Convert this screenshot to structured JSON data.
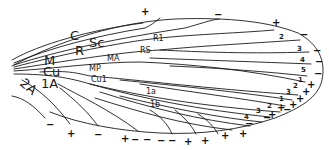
{
  "diagram": {
    "type": "insect-wing-venation",
    "vein_labels": {
      "C": "C",
      "Sc": "Sc",
      "R": "R",
      "R1": "R1",
      "RS": "RS",
      "MA": "MA",
      "M": "M",
      "Cu": "Cu",
      "MP": "MP",
      "Cu1": "Cu1",
      "1A": "1A",
      "2A": "2A",
      "1a": "1a",
      "1b": "1b"
    },
    "margin_numbers": {
      "rs_branches": [
        "2",
        "3",
        "4",
        "5"
      ],
      "mp_branches": [
        "1",
        "2",
        "3"
      ],
      "cu_branches": [
        "1",
        "2",
        "3",
        "4"
      ]
    },
    "signs": {
      "top": [
        "+",
        "−",
        "+"
      ],
      "apex": [
        "−",
        "−",
        "−",
        "−"
      ],
      "lower_right": [
        "+",
        "+",
        "+",
        "+",
        "−",
        "+",
        "+"
      ],
      "bottom": [
        "−",
        "−",
        "+",
        "+",
        "+",
        "−",
        "−",
        "−",
        "−",
        "+",
        "+",
        "−",
        "+",
        "−"
      ]
    },
    "colors": {
      "line": "#1a1a1a",
      "background": "#ffffff"
    }
  }
}
